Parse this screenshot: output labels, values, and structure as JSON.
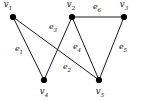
{
  "figure": {
    "kind": "undirected-graph-diagram",
    "background_color": "#ffffff",
    "line_color": "#1a1a1a",
    "vertex_color": "#000000",
    "label_color": "#111111",
    "width": 141,
    "height": 100
  },
  "vertices": [
    {
      "id": "v1",
      "label": "v",
      "sub": "1",
      "x": 13,
      "y": 17,
      "label_x": 8,
      "label_y": 6
    },
    {
      "id": "v2",
      "label": "v",
      "sub": "2",
      "x": 72,
      "y": 17,
      "label_x": 71,
      "label_y": 6
    },
    {
      "id": "v3",
      "label": "v",
      "sub": "3",
      "x": 124,
      "y": 17,
      "label_x": 124,
      "label_y": 6
    },
    {
      "id": "v4",
      "label": "v",
      "sub": "4",
      "x": 44,
      "y": 80,
      "label_x": 44,
      "label_y": 93
    },
    {
      "id": "v5",
      "label": "v",
      "sub": "5",
      "x": 99,
      "y": 80,
      "label_x": 100,
      "label_y": 93
    }
  ],
  "edges": [
    {
      "id": "e1",
      "label": "e",
      "sub": "1",
      "from": "v1",
      "to": "v4",
      "x1": 13,
      "y1": 17,
      "x2": 44,
      "y2": 80,
      "label_x": 19,
      "label_y": 50
    },
    {
      "id": "e2",
      "label": "e",
      "sub": "2",
      "from": "v1",
      "to": "v5",
      "x1": 13,
      "y1": 17,
      "x2": 99,
      "y2": 80,
      "label_x": 67,
      "label_y": 68
    },
    {
      "id": "e3",
      "label": "e",
      "sub": "3",
      "from": "v2",
      "to": "v4",
      "x1": 72,
      "y1": 17,
      "x2": 44,
      "y2": 80,
      "label_x": 53,
      "label_y": 28
    },
    {
      "id": "e4",
      "label": "e",
      "sub": "4",
      "from": "v2",
      "to": "v5",
      "x1": 72,
      "y1": 17,
      "x2": 99,
      "y2": 80,
      "label_x": 77,
      "label_y": 48
    },
    {
      "id": "e5",
      "label": "e",
      "sub": "5",
      "from": "v3",
      "to": "v5",
      "x1": 124,
      "y1": 17,
      "x2": 99,
      "y2": 80,
      "label_x": 123,
      "label_y": 48
    },
    {
      "id": "e6",
      "label": "e",
      "sub": "6",
      "from": "v2",
      "to": "v3",
      "x1": 72,
      "y1": 17,
      "x2": 124,
      "y2": 17,
      "label_x": 97,
      "label_y": 8
    }
  ]
}
